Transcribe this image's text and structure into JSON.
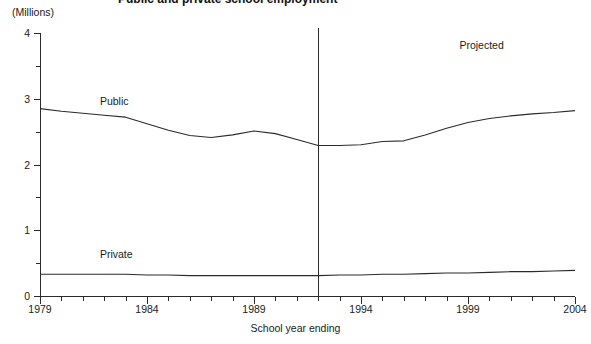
{
  "chart_data": {
    "type": "line",
    "title": "Public and private school employment",
    "units_label": "(Millions)",
    "xlabel": "School year ending",
    "ylabel": "",
    "xlim": [
      1979,
      2004
    ],
    "ylim": [
      0,
      4
    ],
    "y_ticks_major": [
      0,
      1,
      2,
      3,
      4
    ],
    "y_ticks_minor": [
      0.5,
      1.5,
      2.5,
      3.5
    ],
    "y_tick_labels": [
      "0",
      "1",
      "2",
      "3",
      "4"
    ],
    "x_tick_labels": [
      "1979",
      "1984",
      "1989",
      "1994",
      "1999",
      "2004"
    ],
    "x_tick_label_years": [
      1979,
      1984,
      1989,
      1994,
      1999,
      2004
    ],
    "x_ticks_all": [
      1979,
      1980,
      1981,
      1982,
      1983,
      1984,
      1985,
      1986,
      1987,
      1988,
      1989,
      1990,
      1991,
      1992,
      1993,
      1994,
      1995,
      1996,
      1997,
      1998,
      1999,
      2000,
      2001,
      2002,
      2003,
      2004
    ],
    "grid": false,
    "legend_position": "inline-annotation",
    "x": [
      1979,
      1980,
      1981,
      1982,
      1983,
      1984,
      1985,
      1986,
      1987,
      1988,
      1989,
      1990,
      1991,
      1992,
      1993,
      1994,
      1995,
      1996,
      1997,
      1998,
      1999,
      2000,
      2001,
      2002,
      2003,
      2004
    ],
    "series": [
      {
        "name": "Public",
        "label": "Public",
        "color": "#2b2b2b",
        "values": [
          2.85,
          2.81,
          2.78,
          2.75,
          2.72,
          2.62,
          2.52,
          2.44,
          2.41,
          2.45,
          2.51,
          2.47,
          2.38,
          2.29,
          2.29,
          2.3,
          2.35,
          2.36,
          2.45,
          2.55,
          2.64,
          2.7,
          2.74,
          2.77,
          2.79,
          2.82
        ]
      },
      {
        "name": "Private",
        "label": "Private",
        "color": "#2b2b2b",
        "values": [
          0.33,
          0.33,
          0.33,
          0.33,
          0.33,
          0.32,
          0.32,
          0.31,
          0.31,
          0.31,
          0.31,
          0.31,
          0.31,
          0.31,
          0.32,
          0.32,
          0.33,
          0.33,
          0.34,
          0.35,
          0.35,
          0.36,
          0.37,
          0.37,
          0.38,
          0.39
        ]
      }
    ],
    "annotations": [
      {
        "text": "Public",
        "x_year": 1981.8,
        "y_value": 2.95,
        "name": "public-series-label"
      },
      {
        "text": "Private",
        "x_year": 1981.8,
        "y_value": 0.62,
        "name": "private-series-label"
      },
      {
        "text": "Projected",
        "x_year": 1998.6,
        "y_value": 3.8,
        "name": "projected-region-label"
      }
    ],
    "divider": {
      "x_year": 1992,
      "label": "projection-start-divider",
      "color": "#2b2b2b"
    }
  }
}
